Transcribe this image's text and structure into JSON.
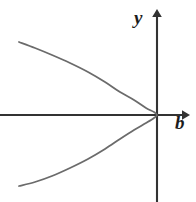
{
  "figure": {
    "title": "",
    "background_color": "#ffffff",
    "width": 196,
    "height": 202
  },
  "axes": {
    "x_axis": {
      "label": "b",
      "icon": "arrow-right-icon",
      "color": "#333333",
      "y_pixel": 115,
      "x_start": 0,
      "x_end": 188,
      "arrow": true
    },
    "y_axis": {
      "label": "y",
      "icon": "arrow-up-icon",
      "color": "#333333",
      "x_pixel": 157,
      "y_start": 202,
      "y_end": 10,
      "arrow": true
    },
    "origin": {
      "x": 157,
      "y": 115
    }
  },
  "chart_data": {
    "type": "line",
    "title": "",
    "xlabel": "b",
    "ylabel": "y",
    "grid": false,
    "legend": null,
    "annotations": [],
    "curve_color": "#6b6b6b",
    "series": [
      {
        "name": "parabola",
        "equation": "b = -k*y^2",
        "vertex": {
          "x": 157,
          "y": 115
        },
        "endpoints": [
          {
            "x": 19,
            "y": 42
          },
          {
            "x": 19,
            "y": 186
          }
        ],
        "points": [
          {
            "x": 19,
            "y": 42
          },
          {
            "x": 35,
            "y": 48
          },
          {
            "x": 52,
            "y": 55
          },
          {
            "x": 70,
            "y": 63
          },
          {
            "x": 88,
            "y": 72
          },
          {
            "x": 105,
            "y": 82
          },
          {
            "x": 120,
            "y": 92
          },
          {
            "x": 134,
            "y": 100
          },
          {
            "x": 146,
            "y": 108
          },
          {
            "x": 154,
            "y": 112
          },
          {
            "x": 157,
            "y": 115
          },
          {
            "x": 154,
            "y": 118
          },
          {
            "x": 146,
            "y": 123
          },
          {
            "x": 134,
            "y": 130
          },
          {
            "x": 120,
            "y": 139
          },
          {
            "x": 105,
            "y": 149
          },
          {
            "x": 88,
            "y": 159
          },
          {
            "x": 70,
            "y": 168
          },
          {
            "x": 52,
            "y": 176
          },
          {
            "x": 35,
            "y": 182
          },
          {
            "x": 19,
            "y": 186
          }
        ]
      }
    ]
  }
}
